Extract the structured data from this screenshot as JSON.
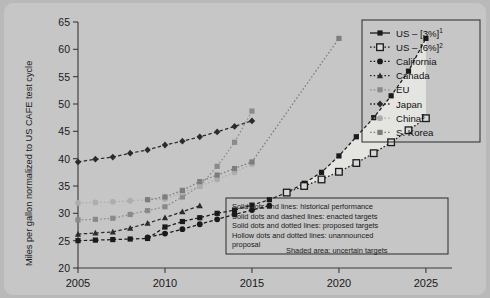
{
  "figure": {
    "background_color": "#b9b9b9",
    "card_color": "#c6c6c6",
    "shaded_area_color": "#e4e4e0"
  },
  "chart_data": {
    "type": "line",
    "title": "",
    "xlabel": "",
    "ylabel": "Miles per gallon normalized to US CAFE test cycle",
    "xlim": [
      2005,
      2026.5
    ],
    "ylim": [
      20,
      65
    ],
    "xticks": [
      2005,
      2010,
      2015,
      2020,
      2025
    ],
    "yticks": [
      20,
      25,
      30,
      35,
      40,
      45,
      50,
      55,
      60,
      65
    ],
    "grid": false,
    "legend_position": "top-right",
    "series": [
      {
        "name": "US – [3%]",
        "superscript": "1",
        "color": "#1a1a1a",
        "marker": "square-filled",
        "line": "dashed",
        "x": [
          2005,
          2006,
          2007,
          2008,
          2009,
          2010,
          2011,
          2012,
          2013,
          2014,
          2015,
          2016,
          2017,
          2018,
          2019,
          2020,
          2021,
          2022,
          2023,
          2024,
          2025
        ],
        "y": [
          25.0,
          25.1,
          25.2,
          25.3,
          25.4,
          27.5,
          28.5,
          29.2,
          30.0,
          30.6,
          31.5,
          32.5,
          33.8,
          35.5,
          37.5,
          40.5,
          44.0,
          47.5,
          51.5,
          56.0,
          62.0
        ]
      },
      {
        "name": "US – [6%]",
        "superscript": "2",
        "color": "#1a1a1a",
        "marker": "square-hollow",
        "line": "dotted",
        "x": [
          2017,
          2018,
          2019,
          2020,
          2021,
          2022,
          2023,
          2024,
          2025
        ],
        "y": [
          33.8,
          35.0,
          36.2,
          37.6,
          39.2,
          41.0,
          43.0,
          45.2,
          47.4
        ]
      },
      {
        "name": "California",
        "color": "#1a1a1a",
        "marker": "circle-filled",
        "line": "dashed",
        "x": [
          2009,
          2010,
          2011,
          2012,
          2013,
          2014,
          2015,
          2016
        ],
        "y": [
          25.6,
          26.3,
          27.1,
          28.0,
          28.9,
          29.8,
          30.6,
          31.4
        ]
      },
      {
        "name": "Canada",
        "color": "#2b2b2b",
        "marker": "triangle-filled",
        "line": "dashed",
        "x": [
          2005,
          2006,
          2007,
          2008,
          2009,
          2010,
          2011,
          2012
        ],
        "y": [
          26.2,
          26.4,
          26.6,
          27.3,
          28.2,
          29.2,
          30.3,
          31.4
        ]
      },
      {
        "name": "EU",
        "color": "#8a8a8a",
        "marker": "square-filled",
        "line": "dotted",
        "x": [
          2005,
          2006,
          2007,
          2008,
          2009,
          2010,
          2011,
          2012,
          2013,
          2014,
          2015
        ],
        "y": [
          28.8,
          28.9,
          29.1,
          29.8,
          30.5,
          31.2,
          33.0,
          35.0,
          38.6,
          43.0,
          48.7
        ]
      },
      {
        "name": "Japan",
        "color": "#2b2b2b",
        "marker": "diamond-filled",
        "line": "dashed",
        "x": [
          2005,
          2006,
          2007,
          2008,
          2009,
          2010,
          2011,
          2012,
          2013,
          2014,
          2015
        ],
        "y": [
          39.4,
          39.9,
          40.3,
          41.0,
          41.6,
          42.5,
          43.2,
          44.0,
          44.9,
          45.9,
          46.9
        ]
      },
      {
        "name": "China",
        "superscript": "3",
        "color": "#adadad",
        "marker": "circle-filled",
        "line": "dotted",
        "x": [
          2005,
          2006,
          2007,
          2008,
          2009,
          2010,
          2011,
          2012,
          2013,
          2014,
          2015
        ],
        "y": [
          31.9,
          32.0,
          32.1,
          32.3,
          32.5,
          32.6,
          33.8,
          35.0,
          36.2,
          37.5,
          39.0
        ]
      },
      {
        "name": "S. Korea",
        "color": "#7d7d7d",
        "marker": "square-filled",
        "line": "dotted",
        "x": [
          2009,
          2010,
          2011,
          2012,
          2013,
          2014,
          2015,
          2020
        ],
        "y": [
          32.5,
          33.0,
          34.2,
          35.8,
          37.0,
          38.2,
          39.4,
          62.0
        ]
      }
    ],
    "annotations": {
      "shaded_area_label": "Shaded area: uncertain targets",
      "notes": [
        "Solid dots and lines: historical performance",
        "Solid dots and dashed lines: enacted targets",
        "Solid dots and dotted lines: proposed targets",
        "Hollow dots and dotted lines: unannounced",
        "proposal"
      ]
    }
  },
  "legend": {
    "items": [
      {
        "label": "US – [3%]",
        "sup": "1",
        "marker": "square-filled",
        "color": "#1a1a1a",
        "line": "solid"
      },
      {
        "label": "US – [6%]",
        "sup": "2",
        "marker": "square-hollow",
        "color": "#1a1a1a",
        "line": "dotted"
      },
      {
        "label": "California",
        "sup": "",
        "marker": "circle-filled",
        "color": "#1a1a1a",
        "line": "dotted"
      },
      {
        "label": "Canada",
        "sup": "",
        "marker": "triangle-filled",
        "color": "#2b2b2b",
        "line": "dotted"
      },
      {
        "label": "EU",
        "sup": "",
        "marker": "square-filled",
        "color": "#8a8a8a",
        "line": "dotted"
      },
      {
        "label": "Japan",
        "sup": "",
        "marker": "diamond-filled",
        "color": "#2b2b2b",
        "line": "dotted"
      },
      {
        "label": "China",
        "sup": "3",
        "marker": "circle-filled",
        "color": "#adadad",
        "line": "dotted"
      },
      {
        "label": "S. Korea",
        "sup": "",
        "marker": "square-filled",
        "color": "#7d7d7d",
        "line": "dotted"
      }
    ]
  },
  "axis": {
    "y_label": "Miles per gallon normalized to US CAFE test cycle",
    "y_ticks": [
      "65",
      "60",
      "55",
      "50",
      "45",
      "40",
      "35",
      "30",
      "25",
      "20"
    ],
    "x_ticks": [
      "2005",
      "2010",
      "2015",
      "2020",
      "2025"
    ]
  }
}
